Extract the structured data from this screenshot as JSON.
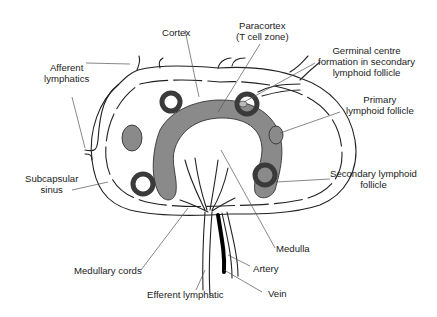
{
  "figure": {
    "labels": {
      "cortex": [
        "Cortex"
      ],
      "paracortex": [
        "Paracortex",
        "(T cell zone)"
      ],
      "germinal_centre": [
        "Germinal centre",
        "formation in secondary",
        "lymphoid follicle"
      ],
      "afferent_lymphatics": [
        "Afferent",
        "lymphatics"
      ],
      "primary_follicle": [
        "Primary",
        "lymphoid follicle"
      ],
      "subcapsular_sinus": [
        "Subcapsular",
        "sinus"
      ],
      "secondary_follicle": [
        "Secondary lymphoid",
        "follicle"
      ],
      "medulla": [
        "Medulla"
      ],
      "medullary_cords": [
        "Medullary cords"
      ],
      "artery": [
        "Artery"
      ],
      "efferent_lymphatic": [
        "Efferent lymphatic"
      ],
      "vein": [
        "Vein"
      ]
    },
    "colors": {
      "outline": "#222222",
      "paracortex_fill": "#8a8a8a",
      "follicle_ring": "#3a3a3a",
      "background": "#ffffff"
    }
  }
}
